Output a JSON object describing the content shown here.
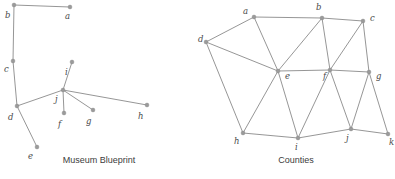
{
  "figure": {
    "panels": [
      {
        "id": "museum-blueprint",
        "caption": "Museum Blueprint",
        "node_color": "#9a9a9a",
        "edge_color": "#8a8a8a",
        "label_color": "#4a4a4a",
        "nodes": [
          {
            "id": "a",
            "label": "a",
            "x": 70,
            "y": 7,
            "lx": 65,
            "ly": 19
          },
          {
            "id": "b",
            "label": "b",
            "x": 14,
            "y": 5,
            "lx": 5,
            "ly": 18
          },
          {
            "id": "c",
            "label": "c",
            "x": 13,
            "y": 61,
            "lx": 4,
            "ly": 72
          },
          {
            "id": "d",
            "label": "d",
            "x": 17,
            "y": 106,
            "lx": 8,
            "ly": 120
          },
          {
            "id": "e",
            "label": "e",
            "x": 37,
            "y": 147,
            "lx": 28,
            "ly": 159
          },
          {
            "id": "f",
            "label": "f",
            "x": 64,
            "y": 113,
            "lx": 58,
            "ly": 127
          },
          {
            "id": "g",
            "label": "g",
            "x": 93,
            "y": 110,
            "lx": 86,
            "ly": 124
          },
          {
            "id": "h",
            "label": "h",
            "x": 147,
            "y": 105,
            "lx": 138,
            "ly": 119
          },
          {
            "id": "i",
            "label": "i",
            "x": 72,
            "y": 62,
            "lx": 65,
            "ly": 75
          },
          {
            "id": "j",
            "label": "j",
            "x": 63,
            "y": 90,
            "lx": 55,
            "ly": 102
          }
        ],
        "edges": [
          [
            "a",
            "b"
          ],
          [
            "b",
            "c"
          ],
          [
            "c",
            "d"
          ],
          [
            "d",
            "e"
          ],
          [
            "d",
            "j"
          ],
          [
            "j",
            "i"
          ],
          [
            "j",
            "f"
          ],
          [
            "j",
            "g"
          ],
          [
            "j",
            "h"
          ]
        ]
      },
      {
        "id": "counties",
        "caption": "Counties",
        "node_color": "#9a9a9a",
        "edge_color": "#8a8a8a",
        "label_color": "#4a4a4a",
        "nodes": [
          {
            "id": "a",
            "label": "a",
            "x": 57,
            "y": 17,
            "lx": 46,
            "ly": 14
          },
          {
            "id": "b",
            "label": "b",
            "x": 125,
            "y": 18,
            "lx": 119,
            "ly": 10
          },
          {
            "id": "c",
            "label": "c",
            "x": 166,
            "y": 21,
            "lx": 173,
            "ly": 21
          },
          {
            "id": "d",
            "label": "d",
            "x": 9,
            "y": 42,
            "lx": 1,
            "ly": 42
          },
          {
            "id": "e",
            "label": "e",
            "x": 81,
            "y": 71,
            "lx": 88,
            "ly": 79
          },
          {
            "id": "f",
            "label": "f",
            "x": 133,
            "y": 70,
            "lx": 126,
            "ly": 79
          },
          {
            "id": "g",
            "label": "g",
            "x": 172,
            "y": 72,
            "lx": 179,
            "ly": 79
          },
          {
            "id": "h",
            "label": "h",
            "x": 46,
            "y": 133,
            "lx": 37,
            "ly": 144
          },
          {
            "id": "i",
            "label": "i",
            "x": 101,
            "y": 138,
            "lx": 98,
            "ly": 150
          },
          {
            "id": "j",
            "label": "j",
            "x": 154,
            "y": 129,
            "lx": 149,
            "ly": 141
          },
          {
            "id": "k",
            "label": "k",
            "x": 191,
            "y": 134,
            "lx": 192,
            "ly": 145
          }
        ],
        "edges": [
          [
            "a",
            "b"
          ],
          [
            "a",
            "d"
          ],
          [
            "a",
            "e"
          ],
          [
            "b",
            "c"
          ],
          [
            "b",
            "e"
          ],
          [
            "b",
            "f"
          ],
          [
            "c",
            "f"
          ],
          [
            "c",
            "g"
          ],
          [
            "d",
            "e"
          ],
          [
            "d",
            "h"
          ],
          [
            "e",
            "f"
          ],
          [
            "e",
            "h"
          ],
          [
            "e",
            "i"
          ],
          [
            "f",
            "g"
          ],
          [
            "f",
            "i"
          ],
          [
            "f",
            "j"
          ],
          [
            "g",
            "j"
          ],
          [
            "g",
            "k"
          ],
          [
            "h",
            "i"
          ],
          [
            "i",
            "j"
          ],
          [
            "j",
            "k"
          ]
        ]
      }
    ]
  }
}
